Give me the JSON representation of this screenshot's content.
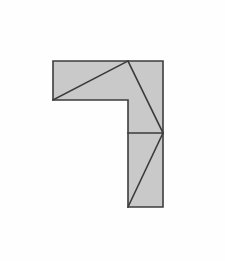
{
  "figure": {
    "type": "geometry-diagram",
    "canvas": {
      "width": 225,
      "height": 261
    },
    "colors": {
      "background": "#fefefe",
      "fill": "#c9c9c9",
      "stroke": "#3d3d3d",
      "divider_stroke": "#3a3a3a"
    },
    "stroke_width": 1.6,
    "vertices": {
      "A": [
        53,
        61
      ],
      "B": [
        128,
        61
      ],
      "C": [
        163,
        61
      ],
      "D": [
        163,
        133
      ],
      "E": [
        163,
        207
      ],
      "F": [
        128,
        207
      ],
      "G": [
        128,
        133
      ],
      "H": [
        128,
        100
      ],
      "I": [
        53,
        100
      ]
    },
    "outline_points": "53,61 163,61 163,207 128,207 128,100 53,100",
    "regions": [
      {
        "name": "horizontal-bar-upper-triangle",
        "points": "53,61 128,61 53,100",
        "fill": "#c9c9c9"
      },
      {
        "name": "horizontal-bar-lower-triangle",
        "points": "53,100 128,61 128,100",
        "fill": "#c9c9c9"
      },
      {
        "name": "vertical-upper-left-triangle",
        "points": "128,61 163,133 128,133",
        "fill": "#c9c9c9"
      },
      {
        "name": "vertical-upper-right-triangle",
        "points": "128,61 163,61 163,133",
        "fill": "#c9c9c9"
      },
      {
        "name": "vertical-lower-left-triangle",
        "points": "128,133 163,133 128,207",
        "fill": "#c9c9c9"
      },
      {
        "name": "vertical-lower-right-triangle",
        "points": "163,133 163,207 128,207",
        "fill": "#c9c9c9"
      }
    ],
    "internal_lines": [
      {
        "name": "diagonal-horizontal-bar",
        "x1": 53,
        "y1": 100,
        "x2": 128,
        "y2": 61
      },
      {
        "name": "diagonal-vertical-upper",
        "x1": 128,
        "y1": 61,
        "x2": 163,
        "y2": 133
      },
      {
        "name": "divider-horizontal-mid",
        "x1": 128,
        "y1": 133,
        "x2": 163,
        "y2": 133
      },
      {
        "name": "diagonal-vertical-lower",
        "x1": 128,
        "y1": 207,
        "x2": 163,
        "y2": 133
      }
    ]
  }
}
